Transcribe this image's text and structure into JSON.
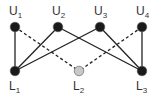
{
  "diagram": {
    "type": "bipartite-graph",
    "upper_nodes": [
      {
        "id": "U1",
        "label": "U",
        "sub": "1",
        "x": 15,
        "y": 27,
        "fill": "#1a1a1a"
      },
      {
        "id": "U2",
        "label": "U",
        "sub": "2",
        "x": 58,
        "y": 27,
        "fill": "#1a1a1a"
      },
      {
        "id": "U3",
        "label": "U",
        "sub": "3",
        "x": 100,
        "y": 27,
        "fill": "#1a1a1a"
      },
      {
        "id": "U4",
        "label": "U",
        "sub": "4",
        "x": 142,
        "y": 27,
        "fill": "#1a1a1a"
      }
    ],
    "lower_nodes": [
      {
        "id": "L1",
        "label": "L",
        "sub": "1",
        "x": 15,
        "y": 71,
        "fill": "#1a1a1a"
      },
      {
        "id": "L2",
        "label": "L",
        "sub": "2",
        "x": 79,
        "y": 71,
        "fill": "#c8c8c8"
      },
      {
        "id": "L3",
        "label": "L",
        "sub": "3",
        "x": 142,
        "y": 71,
        "fill": "#1a1a1a"
      }
    ],
    "edges": [
      {
        "from": "U1",
        "to": "L1",
        "style": "solid"
      },
      {
        "from": "U1",
        "to": "L2",
        "style": "dashed"
      },
      {
        "from": "U2",
        "to": "L1",
        "style": "solid"
      },
      {
        "from": "U2",
        "to": "L3",
        "style": "solid"
      },
      {
        "from": "U3",
        "to": "L1",
        "style": "solid"
      },
      {
        "from": "U3",
        "to": "L3",
        "style": "solid"
      },
      {
        "from": "U4",
        "to": "L2",
        "style": "dashed"
      },
      {
        "from": "U4",
        "to": "L3",
        "style": "solid"
      }
    ],
    "colors": {
      "edge": "#222222",
      "node_dark": "#1a1a1a",
      "node_light": "#c8c8c8"
    }
  }
}
